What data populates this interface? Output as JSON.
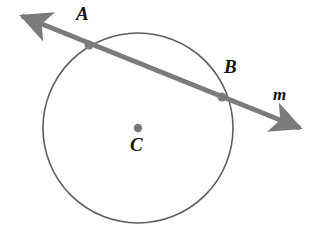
{
  "figure": {
    "kind": "circle-with-secant-line",
    "background_color": "#ffffff"
  },
  "labels": {
    "point_a": "A",
    "point_b": "B",
    "center_c": "C",
    "line_m": "m"
  },
  "colors": {
    "circle_stroke": "#5e5e5e",
    "line_stroke": "#7b7b7b",
    "point_fill": "#7b7b7b",
    "center_fill": "#777777",
    "label_text": "#111111"
  },
  "geometry": {
    "circle": {
      "center_x": 138,
      "center_y": 128,
      "radius": 95,
      "stroke_width": 1.6
    },
    "secant_line": {
      "start_x": 22,
      "start_y": 16,
      "end_x": 300,
      "end_y": 128,
      "stroke_width": 5,
      "arrowheads": "both"
    },
    "point_a": {
      "x": 89,
      "y": 45,
      "radius": 4.5
    },
    "point_b": {
      "x": 222,
      "y": 97,
      "radius": 4.5
    },
    "center_point": {
      "x": 138,
      "y": 128,
      "radius": 4.2
    }
  }
}
